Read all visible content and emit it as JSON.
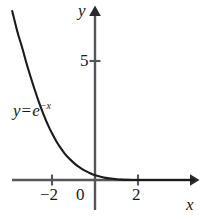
{
  "figure": {
    "background_color": "#ffffff",
    "width": 204,
    "height": 219
  },
  "labels": {
    "x_axis": "x",
    "y_axis": "y",
    "equation_lhs": "y",
    "equation_operator": "=",
    "equation_base": "e",
    "equation_exponent": "−x",
    "equation_full": "y = e⁻ˣ"
  },
  "ticks": {
    "x": [
      {
        "value": -2,
        "label": "−2"
      },
      {
        "value": 0,
        "label": "0"
      },
      {
        "value": 2,
        "label": "2"
      }
    ],
    "y": [
      {
        "value": 5,
        "label": "5"
      }
    ]
  },
  "chart_data": {
    "type": "line",
    "title": "",
    "xlabel": "x",
    "ylabel": "y",
    "series": [
      {
        "name": "y = e^(-x)",
        "function": "exp(-x)",
        "color": "#1a1a1a",
        "line_width": 2.1,
        "x": [
          -3.85,
          -3.6,
          -3.4,
          -3.2,
          -3.0,
          -2.8,
          -2.6,
          -2.4,
          -2.2,
          -2.0,
          -1.8,
          -1.6,
          -1.4,
          -1.2,
          -1.0,
          -0.8,
          -0.6,
          -0.4,
          -0.2,
          0.0,
          0.25,
          0.5,
          0.75,
          1.0,
          1.25,
          1.5,
          1.75,
          2.0,
          2.5,
          3.0,
          3.5,
          4.0,
          4.6
        ],
        "values": [
          7.1,
          6.2,
          5.6,
          4.95,
          4.35,
          3.78,
          3.25,
          2.77,
          2.34,
          1.96,
          1.63,
          1.35,
          1.1,
          0.9,
          0.73,
          0.58,
          0.46,
          0.36,
          0.27,
          0.2,
          0.14,
          0.09,
          0.06,
          0.03,
          0.015,
          0.005,
          0.0,
          0.0,
          0.0,
          0.0,
          0.0,
          0.0,
          0.0
        ]
      }
    ],
    "xlim": [
      -3.9,
      4.75
    ],
    "ylim": [
      -1.25,
      7.4
    ],
    "grid": false,
    "legend": false,
    "annotations": [
      {
        "text": "y = e⁻ˣ",
        "x": -3.35,
        "y": 2.65
      }
    ],
    "axis_style": {
      "color": "#55565a",
      "arrow_heads": [
        "x-positive",
        "y-positive"
      ],
      "origin_label": "0"
    }
  }
}
